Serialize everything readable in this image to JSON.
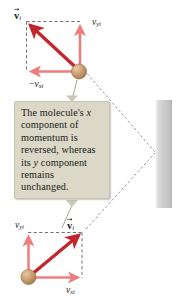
{
  "figure": {
    "name": "molecule-wall-collision-diagram",
    "background_color": "#ffffff",
    "wall": {
      "label": "wall",
      "color_light": "#f2f2f2",
      "color_dark": "#b9b9b9"
    },
    "callout": {
      "background_color": "#dcd8c7",
      "border_color": "#c6c2b0",
      "text": "The molecule's x component of momentum is reversed, whereas its y component remains unchanged.",
      "line1": "The molecule's ",
      "line1_italic": "x",
      "line2": "component of",
      "line3": "momentum is",
      "line4": "reversed, whereas",
      "line5_a": "its ",
      "line5_italic": "y",
      "line5_b": " component",
      "line6": "remains",
      "line7": "unchanged."
    },
    "panels": [
      {
        "id": "before-collision",
        "name": "top-panel",
        "vector_label": "v",
        "vector_subscript": "i",
        "vector_color": "#c1272d",
        "component_color": "#ef7c7c",
        "molecule_color": "#c49a6c",
        "components": [
          {
            "id": "y-component",
            "label": "v",
            "subscript": "yi",
            "sign": "",
            "direction": "up"
          },
          {
            "id": "x-component",
            "label": "v",
            "subscript": "xi",
            "sign": "−",
            "direction": "left"
          }
        ]
      },
      {
        "id": "after-collision",
        "name": "bottom-panel",
        "vector_label": "v",
        "vector_subscript": "i",
        "vector_color": "#c1272d",
        "component_color": "#ef7c7c",
        "molecule_color": "#c49a6c",
        "components": [
          {
            "id": "y-component",
            "label": "v",
            "subscript": "yi",
            "sign": "",
            "direction": "up"
          },
          {
            "id": "x-component",
            "label": "v",
            "subscript": "xi",
            "sign": "",
            "direction": "right"
          }
        ]
      }
    ]
  }
}
